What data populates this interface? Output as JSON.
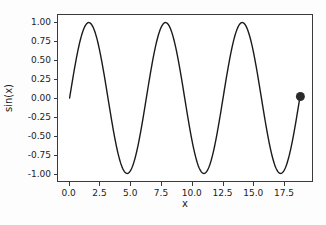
{
  "chart_data": {
    "type": "line",
    "title": "",
    "xlabel": "x",
    "ylabel": "sin(x)",
    "xlim": [
      -0.95,
      19.85
    ],
    "ylim": [
      -1.1,
      1.1
    ],
    "grid": false,
    "legend": null,
    "xticks": [
      0.0,
      2.5,
      5.0,
      7.5,
      10.0,
      12.5,
      15.0,
      17.5
    ],
    "xticklabels": [
      "0.0",
      "2.5",
      "5.0",
      "7.5",
      "10.0",
      "12.5",
      "15.0",
      "17.5"
    ],
    "yticks": [
      1.0,
      0.75,
      0.5,
      0.25,
      0.0,
      -0.25,
      -0.5,
      -0.75,
      -1.0
    ],
    "yticklabels": [
      "1.00",
      "0.75",
      "0.50",
      "0.25",
      "0.00",
      "-0.25",
      "-0.50",
      "-0.75",
      "-1.00"
    ],
    "series": [
      {
        "name": "sin(x)",
        "color": "#1a1a1a",
        "linewidth": 1.4,
        "x_start": 0.0,
        "x_end": 18.9,
        "samples": 400,
        "function": "sin",
        "amplitude": 1.0,
        "periods": 3.0
      }
    ],
    "markers": [
      {
        "name": "end-point-marker",
        "x": 18.9,
        "y": 0.02,
        "color": "#2b2b2b",
        "size": 9,
        "shape": "circle"
      }
    ],
    "annotations": []
  },
  "figure": {
    "background_color": "#fdfdfd",
    "axes_background_color": "#ffffff",
    "axes_edge_color": "#3a3a3a"
  }
}
